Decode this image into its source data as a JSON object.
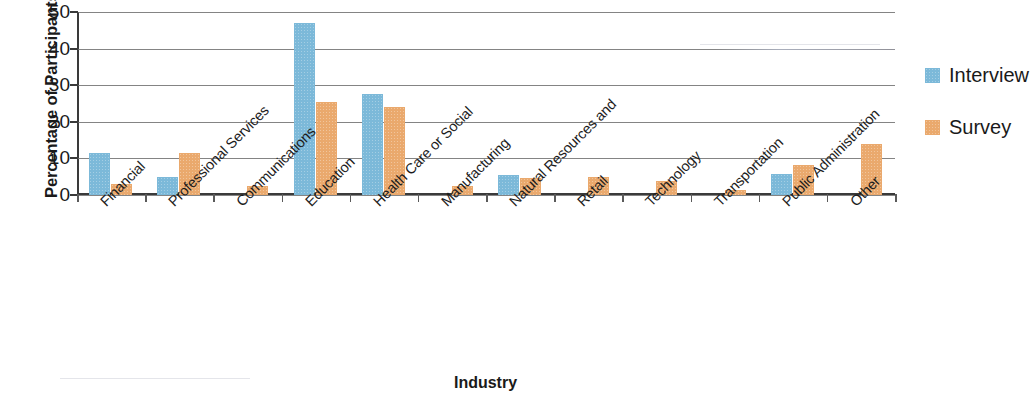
{
  "chart_data": {
    "type": "bar",
    "title": "",
    "xlabel": "Industry",
    "ylabel": "Percentage of Participants",
    "ylim": [
      0,
      50
    ],
    "yticks": [
      0,
      10,
      20,
      30,
      40,
      50
    ],
    "grid": true,
    "legend_position": "right",
    "categories": [
      "Financial",
      "Professional Services",
      "Communications",
      "Education",
      "Health Care or Social",
      "Manufacturing",
      "Natural Resources and",
      "Retail",
      "Technology",
      "Transportation",
      "Public Administration",
      "Other"
    ],
    "series": [
      {
        "name": "Interview",
        "color": "#7cb9d9",
        "values": [
          11.5,
          5.0,
          0,
          47.0,
          27.5,
          0,
          5.5,
          0,
          0,
          0,
          5.7,
          0
        ]
      },
      {
        "name": "Survey",
        "color": "#eaa96d",
        "values": [
          3.0,
          11.5,
          2.5,
          25.5,
          24.0,
          2.5,
          4.6,
          5.0,
          3.8,
          1.3,
          8.3,
          14.0
        ]
      }
    ]
  },
  "legend": {
    "items": [
      {
        "label": "Interview",
        "color": "#7cb9d9"
      },
      {
        "label": "Survey",
        "color": "#eaa96d"
      }
    ]
  },
  "axes": {
    "y_title": "Percentage of Participants",
    "x_title": "Industry",
    "y_tick_labels": [
      "50",
      "40",
      "30",
      "20",
      "10",
      "0"
    ]
  }
}
